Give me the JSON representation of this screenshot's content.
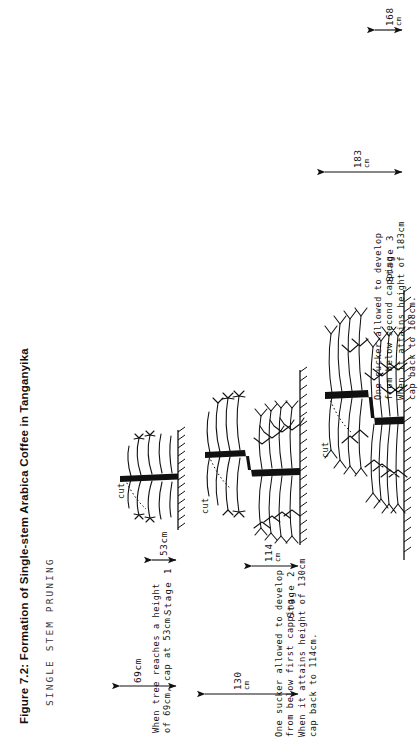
{
  "figure": {
    "title": "Figure 7.2: Formation of Single-stem Arabica Coffee in Tanganyika",
    "subtitle": "SINGLE STEM PRUNING"
  },
  "labels": {
    "cut": "cut",
    "unit": "cm"
  },
  "stages": [
    {
      "id": "stage-1",
      "label": "Stage 1",
      "caption_lines": [
        "When tree reaches a height",
        "of 69cm, cap at 53cm."
      ],
      "dimensions": [
        {
          "name": "cap-height",
          "value": "53cm",
          "has_unit_line": false
        },
        {
          "name": "tree-height",
          "value": "69cm",
          "has_unit_line": false
        }
      ]
    },
    {
      "id": "stage-2",
      "label": "Stage 2",
      "caption_lines": [
        "One sucker allowed to develop",
        "from below first capping.",
        "When it attains height of 130cm",
        "cap back to 114cm."
      ],
      "dimensions": [
        {
          "name": "cap-height",
          "value": "114",
          "has_unit_line": true
        },
        {
          "name": "tree-height",
          "value": "130",
          "has_unit_line": true
        }
      ]
    },
    {
      "id": "stage-3",
      "label": "Stage 3",
      "caption_lines": [
        "One sucker allowed to develop",
        "from below second capping.",
        "When it attains height of 183cm",
        "cap back to 168cm."
      ],
      "dimensions": [
        {
          "name": "cap-height",
          "value": "168",
          "has_unit_line": true
        },
        {
          "name": "tree-height",
          "value": "183",
          "has_unit_line": true
        }
      ]
    }
  ],
  "colors": {
    "ink": "#111111",
    "paper": "#ffffff"
  }
}
